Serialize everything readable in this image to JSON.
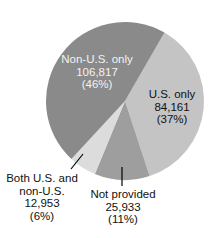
{
  "chart_data": {
    "type": "pie",
    "title": "",
    "slices": [
      {
        "label": "Non-U.S. only",
        "value": 106817,
        "percent": 46,
        "value_text": "106,817",
        "percent_text": "(46%)",
        "color": "#8a8a8a"
      },
      {
        "label": "U.S. only",
        "value": 84161,
        "percent": 37,
        "value_text": "84,161",
        "percent_text": "(37%)",
        "color": "#c4c4c4"
      },
      {
        "label": "Not provided",
        "value": 25933,
        "percent": 11,
        "value_text": "25,933",
        "percent_text": "(11%)",
        "color": "#9e9e9e"
      },
      {
        "label": "Both U.S. and non-U.S.",
        "value": 12953,
        "percent": 6,
        "value_text": "12,953",
        "percent_text": "(6%)",
        "color": "#dcdcdc"
      }
    ],
    "labels": {
      "non_us": {
        "line1": "Non-U.S. only",
        "line2": "106,817",
        "line3": "(46%)"
      },
      "us": {
        "line1": "U.S. only",
        "line2": "84,161",
        "line3": "(37%)"
      },
      "not_provided": {
        "line1": "Not provided",
        "line2": "25,933",
        "line3": "(11%)"
      },
      "both": {
        "line1": "Both U.S. and",
        "line2": "non-U.S.",
        "line3": "12,953",
        "line4": "(6%)"
      }
    },
    "legend": "none (direct labels)"
  }
}
